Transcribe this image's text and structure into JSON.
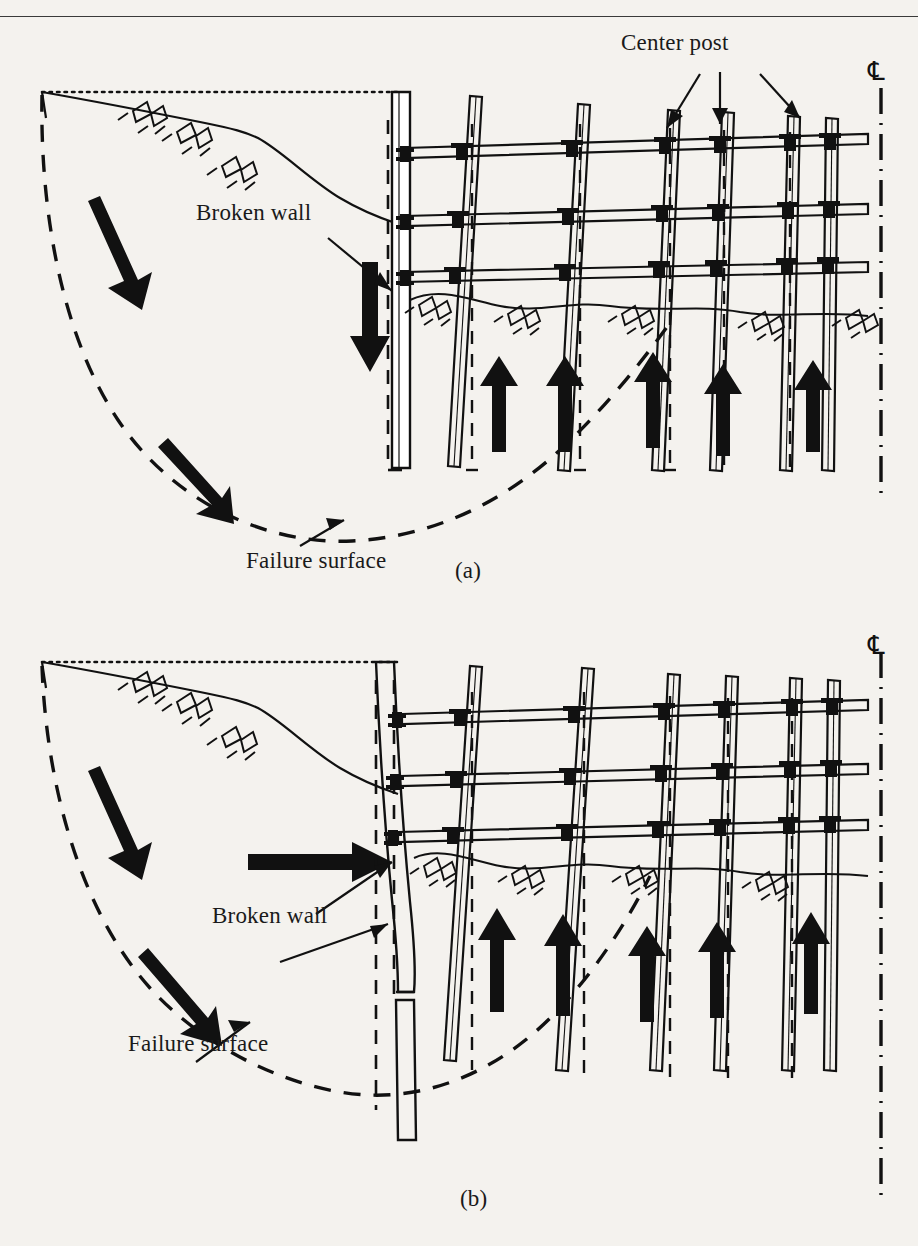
{
  "figure": {
    "type": "engineering-cross-section-diagram",
    "top_rule": true
  },
  "labels": {
    "center_post": "Center post",
    "broken_wall": "Broken wall",
    "failure_surface": "Failure surface",
    "panel_a": "(a)",
    "panel_b": "(b)",
    "centerline_symbol": "℄"
  },
  "panels": [
    {
      "id": "a",
      "caption": "(a)",
      "annotations": [
        "Center post",
        "Broken wall",
        "Failure surface"
      ],
      "centerline_symbol": "℄",
      "features": {
        "original_ground_line": "dotted horizontal",
        "settled_ground_surface": "solid descending curve with hatch marks",
        "failure_surface": "dashed circular arc",
        "wall": "vertical, displaced downward",
        "movement_arrows": {
          "down_slope_arrows": 2,
          "wall_down_arrow": 1,
          "heave_up_arrows": 5
        },
        "strut_levels": 3,
        "post_count": 6
      }
    },
    {
      "id": "b",
      "caption": "(b)",
      "annotations": [
        "Broken wall",
        "Failure surface"
      ],
      "centerline_symbol": "℄",
      "features": {
        "original_ground_line": "dotted horizontal",
        "settled_ground_surface": "solid descending curve with hatch marks",
        "failure_surface": "dashed circular arc",
        "wall": "bowed inward, broken at failure surface",
        "movement_arrows": {
          "down_slope_arrows": 2,
          "wall_horizontal_arrow": 1,
          "heave_up_arrows": 5
        },
        "strut_levels": 3,
        "post_count": 6
      }
    }
  ],
  "colors": {
    "ink": "#111111",
    "paper": "#f4f2ee",
    "rule": "#3a3a3a"
  }
}
